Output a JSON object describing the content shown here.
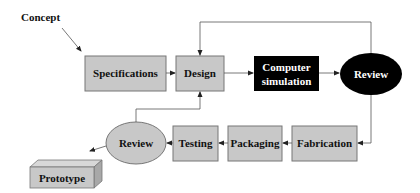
{
  "diagram": {
    "concept_label": "Concept",
    "nodes": {
      "specifications": "Specifications",
      "design": "Design",
      "computer_simulation_line1": "Computer",
      "computer_simulation_line2": "simulation",
      "review_top": "Review",
      "fabrication": "Fabrication",
      "packaging": "Packaging",
      "testing": "Testing",
      "review_bottom": "Review",
      "prototype": "Prototype"
    },
    "colors": {
      "box_fill": "#c8c8c8",
      "box_stroke": "#777777",
      "dark_fill": "#000000",
      "dark_text": "#ffffff",
      "line": "#555555",
      "text": "#111111"
    }
  }
}
